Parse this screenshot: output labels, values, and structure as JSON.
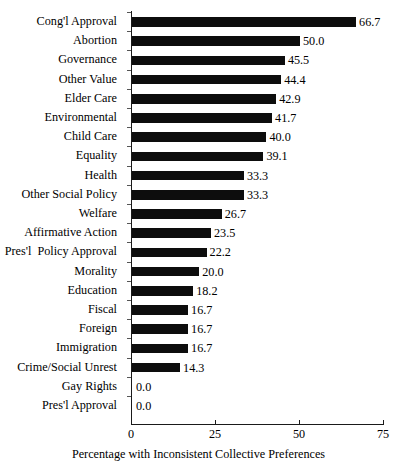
{
  "chart_data": {
    "type": "bar",
    "orientation": "horizontal",
    "title": "",
    "xlabel": "Percentage with Inconsistent Collective Preferences",
    "ylabel": "",
    "xlim": [
      0,
      75
    ],
    "xticks": [
      "0",
      "25",
      "50",
      "75"
    ],
    "grid": false,
    "legend": null,
    "bar_color": "#0d0d0d",
    "axis_color": "#1a1a1a",
    "categories": [
      "Cong'l Approval",
      "Abortion",
      "Governance",
      "Other Value",
      "Elder Care",
      "Environmental",
      "Child Care",
      "Equality",
      "Health",
      "Other Social Policy",
      "Welfare",
      "Affirmative Action",
      "Pres'l  Policy Approval",
      "Morality",
      "Education",
      "Fiscal",
      "Foreign",
      "Immigration",
      "Crime/Social Unrest",
      "Gay Rights",
      "Pres'l Approval"
    ],
    "values": [
      66.7,
      50.0,
      45.5,
      44.4,
      42.9,
      41.7,
      40.0,
      39.1,
      33.3,
      33.3,
      26.7,
      23.5,
      22.2,
      20.0,
      18.2,
      16.7,
      16.7,
      16.7,
      14.3,
      0.0,
      0.0
    ],
    "value_labels": [
      "66.7",
      "50.0",
      "45.5",
      "44.4",
      "42.9",
      "41.7",
      "40.0",
      "39.1",
      "33.3",
      "33.3",
      "26.7",
      "23.5",
      "22.2",
      "20.0",
      "18.2",
      "16.7",
      "16.7",
      "16.7",
      "14.3",
      "0.0",
      "0.0"
    ]
  }
}
